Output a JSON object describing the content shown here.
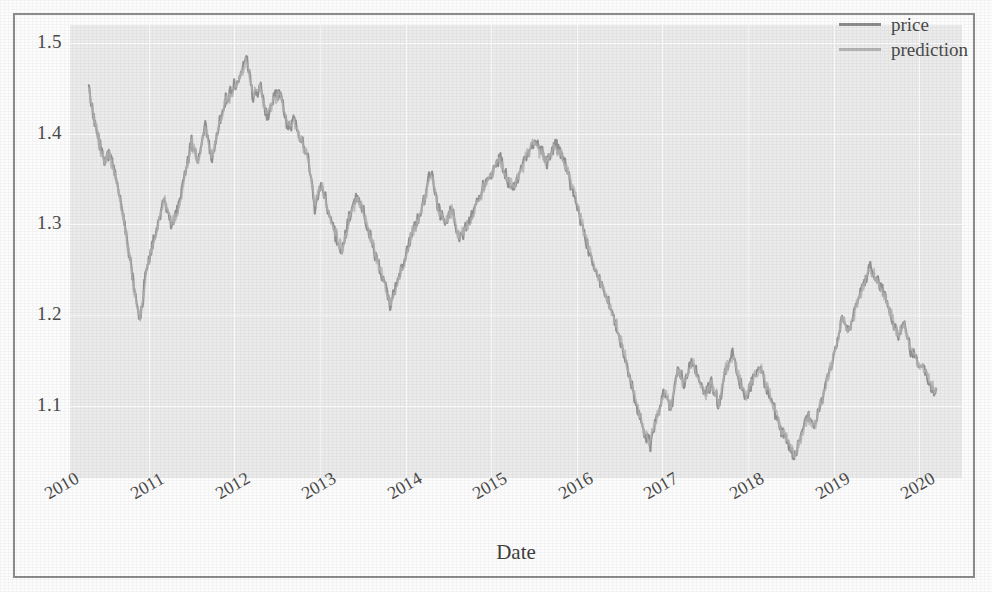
{
  "figure": {
    "background_color": "#fdfdfd",
    "frame_color": "#8d8d8d",
    "plot_bg_color": "#ececec",
    "grid_color": "#fbfbfb"
  },
  "legend": {
    "position": "upper right",
    "entries": [
      {
        "label": "price",
        "color": "#8d8d8d"
      },
      {
        "label": "prediction",
        "color": "#b4b4b4"
      }
    ]
  },
  "axes": {
    "xlabel": "Date",
    "ylabel": "",
    "ytick_labels": [
      "1.5",
      "1.4",
      "1.3",
      "1.2",
      "1.1"
    ],
    "xtick_labels": [
      "2010",
      "2011",
      "2012",
      "2013",
      "2014",
      "2015",
      "2016",
      "2017",
      "2018",
      "2019",
      "2020"
    ],
    "xtick_rotation_deg": -30
  },
  "chart_data": {
    "type": "line",
    "title": "",
    "xlabel": "Date",
    "ylabel": "",
    "xlim": [
      "2010",
      "2020"
    ],
    "ylim": [
      1.02,
      1.52
    ],
    "yticks": [
      1.1,
      1.2,
      1.3,
      1.4,
      1.5
    ],
    "xticks": [
      "2010",
      "2011",
      "2012",
      "2013",
      "2014",
      "2015",
      "2016",
      "2017",
      "2018",
      "2019",
      "2020"
    ],
    "grid": true,
    "legend_position": "upper right",
    "x": [
      2010.3,
      2010.36,
      2010.42,
      2010.48,
      2010.54,
      2010.6,
      2010.66,
      2010.72,
      2010.78,
      2010.84,
      2010.9,
      2010.96,
      2011.02,
      2011.1,
      2011.18,
      2011.26,
      2011.34,
      2011.42,
      2011.5,
      2011.58,
      2011.66,
      2011.74,
      2011.82,
      2011.9,
      2011.98,
      2012.06,
      2012.14,
      2012.22,
      2012.3,
      2012.38,
      2012.46,
      2012.54,
      2012.62,
      2012.7,
      2012.78,
      2012.86,
      2012.94,
      2013.02,
      2013.1,
      2013.18,
      2013.26,
      2013.34,
      2013.42,
      2013.5,
      2013.58,
      2013.66,
      2013.74,
      2013.82,
      2013.9,
      2013.98,
      2014.06,
      2014.14,
      2014.22,
      2014.3,
      2014.38,
      2014.46,
      2014.54,
      2014.62,
      2014.7,
      2014.78,
      2014.86,
      2014.94,
      2015.02,
      2015.1,
      2015.18,
      2015.26,
      2015.34,
      2015.42,
      2015.5,
      2015.58,
      2015.66,
      2015.74,
      2015.82,
      2015.9,
      2015.98,
      2016.06,
      2016.14,
      2016.22,
      2016.3,
      2016.38,
      2016.46,
      2016.54,
      2016.62,
      2016.7,
      2016.78,
      2016.86,
      2016.94,
      2017.02,
      2017.1,
      2017.18,
      2017.26,
      2017.34,
      2017.42,
      2017.5,
      2017.58,
      2017.66,
      2017.74,
      2017.82,
      2017.9,
      2017.98,
      2018.06,
      2018.14,
      2018.22,
      2018.3,
      2018.38,
      2018.46,
      2018.54,
      2018.62,
      2018.7,
      2018.78,
      2018.86,
      2018.94,
      2019.02,
      2019.1,
      2019.18,
      2019.26,
      2019.34,
      2019.42,
      2019.5,
      2019.58,
      2019.66,
      2019.74,
      2019.82,
      2019.9,
      2019.98,
      2020.06,
      2020.14,
      2020.2
    ],
    "series": [
      {
        "name": "price",
        "color": "#8d8d8d",
        "values": [
          1.451,
          1.42,
          1.392,
          1.372,
          1.378,
          1.362,
          1.33,
          1.3,
          1.262,
          1.222,
          1.192,
          1.242,
          1.268,
          1.296,
          1.332,
          1.298,
          1.318,
          1.352,
          1.392,
          1.368,
          1.412,
          1.372,
          1.412,
          1.436,
          1.448,
          1.462,
          1.483,
          1.441,
          1.452,
          1.42,
          1.438,
          1.446,
          1.404,
          1.418,
          1.392,
          1.378,
          1.32,
          1.344,
          1.312,
          1.288,
          1.268,
          1.306,
          1.33,
          1.318,
          1.288,
          1.262,
          1.24,
          1.21,
          1.232,
          1.258,
          1.288,
          1.306,
          1.33,
          1.36,
          1.318,
          1.3,
          1.318,
          1.284,
          1.296,
          1.312,
          1.33,
          1.348,
          1.36,
          1.372,
          1.352,
          1.338,
          1.36,
          1.378,
          1.392,
          1.382,
          1.368,
          1.39,
          1.378,
          1.356,
          1.33,
          1.3,
          1.272,
          1.248,
          1.232,
          1.21,
          1.188,
          1.16,
          1.13,
          1.098,
          1.072,
          1.058,
          1.092,
          1.114,
          1.098,
          1.14,
          1.122,
          1.152,
          1.13,
          1.112,
          1.126,
          1.1,
          1.142,
          1.156,
          1.126,
          1.108,
          1.132,
          1.144,
          1.12,
          1.098,
          1.072,
          1.058,
          1.042,
          1.068,
          1.09,
          1.078,
          1.106,
          1.136,
          1.162,
          1.198,
          1.18,
          1.21,
          1.232,
          1.252,
          1.238,
          1.228,
          1.2,
          1.178,
          1.19,
          1.162,
          1.15,
          1.14,
          1.12,
          1.118
        ]
      },
      {
        "name": "prediction",
        "color": "#b4b4b4",
        "values": [
          1.448,
          1.418,
          1.39,
          1.37,
          1.376,
          1.36,
          1.328,
          1.298,
          1.26,
          1.22,
          1.194,
          1.24,
          1.266,
          1.294,
          1.33,
          1.3,
          1.316,
          1.35,
          1.39,
          1.37,
          1.41,
          1.374,
          1.41,
          1.434,
          1.446,
          1.46,
          1.48,
          1.443,
          1.45,
          1.422,
          1.436,
          1.444,
          1.406,
          1.416,
          1.39,
          1.376,
          1.322,
          1.342,
          1.314,
          1.29,
          1.27,
          1.304,
          1.328,
          1.316,
          1.29,
          1.264,
          1.242,
          1.212,
          1.23,
          1.256,
          1.286,
          1.304,
          1.328,
          1.358,
          1.32,
          1.302,
          1.316,
          1.286,
          1.294,
          1.31,
          1.328,
          1.346,
          1.358,
          1.37,
          1.354,
          1.34,
          1.358,
          1.376,
          1.39,
          1.38,
          1.37,
          1.388,
          1.376,
          1.358,
          1.332,
          1.302,
          1.274,
          1.25,
          1.234,
          1.212,
          1.19,
          1.162,
          1.132,
          1.1,
          1.074,
          1.06,
          1.09,
          1.112,
          1.1,
          1.138,
          1.124,
          1.15,
          1.132,
          1.114,
          1.124,
          1.102,
          1.14,
          1.154,
          1.128,
          1.11,
          1.13,
          1.142,
          1.122,
          1.1,
          1.074,
          1.06,
          1.044,
          1.066,
          1.088,
          1.08,
          1.104,
          1.134,
          1.16,
          1.196,
          1.182,
          1.208,
          1.23,
          1.25,
          1.24,
          1.226,
          1.202,
          1.18,
          1.188,
          1.164,
          1.148,
          1.142,
          1.122,
          1.116
        ]
      }
    ]
  }
}
